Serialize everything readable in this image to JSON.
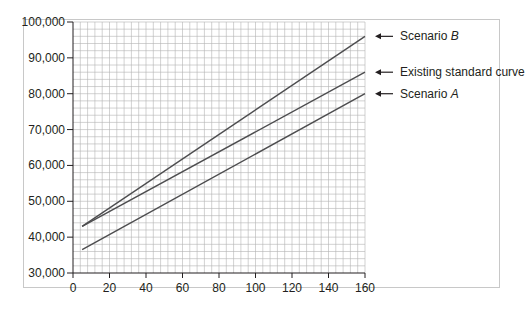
{
  "chart_data": {
    "type": "line",
    "title": "",
    "xlabel": "",
    "ylabel": "",
    "xlim": [
      0,
      160
    ],
    "ylim": [
      30000,
      100000
    ],
    "x_ticks": [
      0,
      20,
      40,
      60,
      80,
      100,
      120,
      140,
      160
    ],
    "x_tick_labels": [
      "0",
      "20",
      "40",
      "60",
      "80",
      "100",
      "120",
      "140",
      "160"
    ],
    "y_ticks": [
      30000,
      40000,
      50000,
      60000,
      70000,
      80000,
      90000,
      100000
    ],
    "y_tick_labels": [
      "30,000",
      "40,000",
      "50,000",
      "60,000",
      "70,000",
      "80,000",
      "90,000",
      "100,000"
    ],
    "grid": true,
    "grid_minor": {
      "x_step": 4,
      "y_step": 2000
    },
    "legend_position": "right, arrow-annotations",
    "series": [
      {
        "name": "Scenario B",
        "name_plain": "Scenario ",
        "name_italic": "B",
        "x": [
          5,
          160
        ],
        "y": [
          43000,
          96000
        ],
        "color": "#4d4d4f"
      },
      {
        "name": "Existing standard curve",
        "name_plain": "Existing standard curve",
        "name_italic": "",
        "x": [
          5,
          160
        ],
        "y": [
          43000,
          86000
        ],
        "color": "#4d4d4f"
      },
      {
        "name": "Scenario A",
        "name_plain": "Scenario ",
        "name_italic": "A",
        "x": [
          5,
          160
        ],
        "y": [
          36500,
          80000
        ],
        "color": "#4d4d4f"
      }
    ]
  },
  "colors": {
    "grid": "#b4b4b4",
    "axis": "#231f20",
    "line": "#4d4d4f",
    "frame": "#c8c8c8"
  }
}
